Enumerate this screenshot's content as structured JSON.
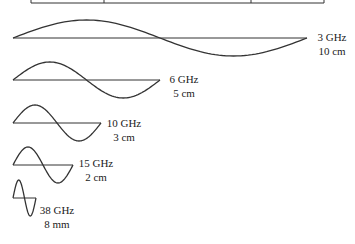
{
  "diagram": {
    "type": "sine-wavelength-comparison",
    "table_edge": {
      "left": 31,
      "right": 324,
      "bottom": 3,
      "dividers": [
        104,
        251
      ]
    },
    "waves": [
      {
        "freq": "3 GHz",
        "wavelength": "10 cm",
        "x0": 13,
        "x1": 307,
        "baseline": 38,
        "amp": 18,
        "cycles": 1,
        "label_x": 332,
        "label_y": 30
      },
      {
        "freq": "6 GHz",
        "wavelength": "5 cm",
        "x0": 13,
        "x1": 160,
        "baseline": 80,
        "amp": 18,
        "cycles": 1,
        "label_x": 184,
        "label_y": 72
      },
      {
        "freq": "10 GHz",
        "wavelength": "3 cm",
        "x0": 13,
        "x1": 101,
        "baseline": 123,
        "amp": 18,
        "cycles": 1,
        "label_x": 124,
        "label_y": 116
      },
      {
        "freq": "15 GHz",
        "wavelength": "2 cm",
        "x0": 13,
        "x1": 73,
        "baseline": 165,
        "amp": 18,
        "cycles": 1,
        "label_x": 96,
        "label_y": 156
      },
      {
        "freq": "38 GHz",
        "wavelength": "8 mm",
        "x0": 13,
        "x1": 36,
        "baseline": 198,
        "amp": 18,
        "cycles": 1,
        "label_x": 57,
        "label_y": 203
      }
    ],
    "stroke_color": "#333333"
  }
}
